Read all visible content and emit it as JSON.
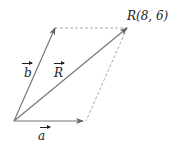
{
  "diagram": {
    "type": "vector-parallelogram",
    "vectors": [
      {
        "name": "a",
        "label": "a",
        "from": [
          14,
          121
        ],
        "to": [
          82,
          121
        ]
      },
      {
        "name": "b",
        "label": "b",
        "from": [
          14,
          121
        ],
        "to": [
          55,
          28
        ]
      },
      {
        "name": "R",
        "label": "R",
        "from": [
          14,
          121
        ],
        "to": [
          127,
          28
        ]
      }
    ],
    "point_label": "R(8, 6)",
    "dashed_edges": [
      {
        "from": [
          55,
          28
        ],
        "to": [
          127,
          28
        ]
      },
      {
        "from": [
          127,
          28
        ],
        "to": [
          86,
          121
        ]
      }
    ],
    "colors": {
      "vector": "#777777",
      "dashed": "#aaaaaa",
      "text": "#222222"
    }
  }
}
